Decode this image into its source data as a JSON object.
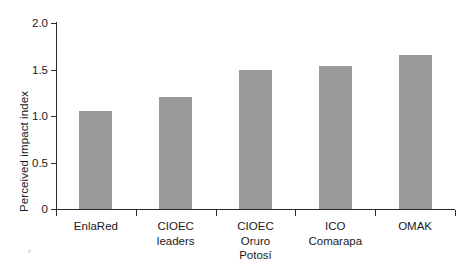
{
  "chart_data": {
    "type": "bar",
    "title": "",
    "xlabel": "",
    "ylabel": "Perceived impact index",
    "categories": [
      "EnlaRed",
      "CIOEC leaders",
      "CIOEC Oruro Potosí",
      "ICO Comarapa",
      "OMAK"
    ],
    "category_lines": [
      [
        "EnlaRed"
      ],
      [
        "CIOEC",
        "leaders"
      ],
      [
        "CIOEC",
        "Oruro",
        "Potosí"
      ],
      [
        "ICO",
        "Comarapa"
      ],
      [
        "OMAK"
      ]
    ],
    "values": [
      1.05,
      1.2,
      1.49,
      1.54,
      1.66
    ],
    "ylim": [
      0,
      2.0
    ],
    "yticks": [
      0,
      0.5,
      1.0,
      1.5,
      2.0
    ],
    "ytick_labels": [
      "0",
      "0.5",
      "1.0",
      "1.5",
      "2.0"
    ],
    "grid": false,
    "legend": null,
    "bar_color": "#9a9a9a",
    "axis_color": "#2b2b2b",
    "background_color": "#ffffff"
  }
}
